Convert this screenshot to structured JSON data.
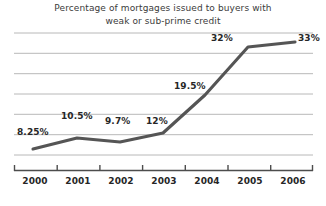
{
  "chart_data": {
    "type": "line",
    "title": "Percentage of mortgages issued to buyers with weak or sub-prime credit",
    "title_line1": "Percentage of mortgages issued to buyers with",
    "title_line2": "weak or sub-prime credit",
    "xlabel": "",
    "ylabel": "",
    "categories": [
      "2000",
      "2001",
      "2002",
      "2003",
      "2004",
      "2005",
      "2006"
    ],
    "values": [
      8.25,
      10.5,
      9.7,
      12,
      19.5,
      32,
      33
    ],
    "point_labels": [
      "8.25%",
      "10.5%",
      "9.7%",
      "12%",
      "19.5%",
      "32%",
      "33%"
    ],
    "ylim": [
      0,
      38
    ],
    "grid": true,
    "gridline_count": 7,
    "legend": "none",
    "series": [
      {
        "name": "Sub-prime share",
        "values": [
          8.25,
          10.5,
          9.7,
          12,
          19.5,
          32,
          33
        ]
      }
    ],
    "colors": {
      "line": "#555555",
      "grid": "#b8b8b8",
      "axis": "#4d4d4d",
      "text": "#262626",
      "title": "#3b3b3b",
      "background": "#ffffff"
    }
  },
  "points": [
    {
      "label": "8.25%",
      "year": "2000",
      "x": 33,
      "y": 149,
      "lx": 17,
      "ly": 127
    },
    {
      "label": "10.5%",
      "year": "2001",
      "x": 77,
      "y": 138,
      "lx": 61,
      "ly": 111
    },
    {
      "label": "9.7%",
      "year": "2002",
      "x": 120,
      "y": 142,
      "lx": 105,
      "ly": 116
    },
    {
      "label": "12%",
      "year": "2003",
      "x": 163,
      "y": 133,
      "lx": 146,
      "ly": 116
    },
    {
      "label": "19.5%",
      "year": "2004",
      "x": 205,
      "y": 95,
      "lx": 174,
      "ly": 81
    },
    {
      "label": "32%",
      "year": "2005",
      "x": 248,
      "y": 47,
      "lx": 211,
      "ly": 33
    },
    {
      "label": "33%",
      "year": "2006",
      "x": 295,
      "y": 42,
      "lx": 298,
      "ly": 33
    }
  ],
  "xaxis": {
    "labels": [
      {
        "text": "2000",
        "cx": 35
      },
      {
        "text": "2001",
        "cx": 78
      },
      {
        "text": "2002",
        "cx": 121
      },
      {
        "text": "2003",
        "cx": 164
      },
      {
        "text": "2004",
        "cx": 207
      },
      {
        "text": "2005",
        "cx": 250
      },
      {
        "text": "2006",
        "cx": 293
      }
    ]
  }
}
